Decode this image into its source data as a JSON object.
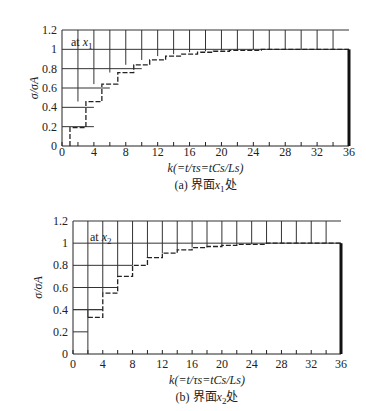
{
  "chart_data": [
    {
      "type": "line",
      "subtype": "step",
      "caption": "(a) 界面x₁处",
      "annotation": "at x₁",
      "xlabel": "k(=t/τs=tCs/Ls)",
      "ylabel": "σ/σA",
      "xlim": [
        0,
        36
      ],
      "ylim": [
        0,
        1.2
      ],
      "xticks": [
        0,
        4,
        8,
        12,
        16,
        20,
        24,
        28,
        32,
        36
      ],
      "yticks": [
        0,
        0.2,
        0.4,
        0.6,
        0.8,
        1,
        1.2
      ],
      "grid": "step staircase grid (solid) with vertical lines every 2 units of k above the curve",
      "series": [
        {
          "name": "dashed step response",
          "style": "dashed",
          "x": [
            1,
            3,
            5,
            7,
            9,
            11,
            13,
            15,
            17,
            19,
            21,
            23,
            25,
            27,
            29,
            31,
            33,
            35
          ],
          "values": [
            0.19,
            0.46,
            0.64,
            0.76,
            0.84,
            0.89,
            0.93,
            0.95,
            0.97,
            0.98,
            0.99,
            0.99,
            1.0,
            1.0,
            1.0,
            1.0,
            1.0,
            1.0
          ]
        },
        {
          "name": "solid staircase (upper grid)",
          "style": "solid",
          "x": [
            0,
            2,
            4,
            6,
            8,
            10,
            12,
            14,
            16,
            18,
            20,
            22,
            24,
            26,
            28,
            30,
            32,
            34
          ],
          "values": [
            0.2,
            0.4,
            0.6,
            0.8,
            0.8,
            1.0,
            1.0,
            1.2,
            1.2,
            1.2,
            1.2,
            1.2,
            1.2,
            1.2,
            1.2,
            1.2,
            1.2,
            1.2
          ]
        }
      ],
      "end_marker": {
        "x": 36,
        "from": 0,
        "to": 1.0,
        "style": "thick vertical line"
      }
    },
    {
      "type": "line",
      "subtype": "step",
      "caption": "(b) 界面x₂处",
      "annotation": "at x₂",
      "xlabel": "k(=t/τs=tCs/Ls)",
      "ylabel": "σ/σA",
      "xlim": [
        0,
        36
      ],
      "ylim": [
        0,
        1.2
      ],
      "xticks": [
        0,
        4,
        8,
        12,
        16,
        20,
        24,
        28,
        32,
        36
      ],
      "yticks": [
        0,
        0.2,
        0.4,
        0.6,
        0.8,
        1,
        1.2
      ],
      "grid": "step staircase grid (solid) with vertical lines every 2 units of k above the curve",
      "series": [
        {
          "name": "dashed step response",
          "style": "dashed",
          "x": [
            2,
            4,
            6,
            8,
            10,
            12,
            14,
            16,
            18,
            20,
            22,
            24,
            26,
            28,
            30,
            32,
            34,
            36
          ],
          "values": [
            0.33,
            0.55,
            0.7,
            0.8,
            0.87,
            0.91,
            0.94,
            0.96,
            0.97,
            0.98,
            0.99,
            0.99,
            1.0,
            1.0,
            1.0,
            1.0,
            1.0,
            1.0
          ]
        }
      ],
      "end_marker": {
        "x": 36,
        "from": 0,
        "to": 1.0,
        "style": "thick vertical line"
      }
    }
  ],
  "labels": {
    "a_caption_prefix": "(a) 界面",
    "a_caption_var": "x",
    "a_caption_sub": "1",
    "a_caption_suffix": "处",
    "b_caption_prefix": "(b) 界面",
    "b_caption_var": "x",
    "b_caption_sub": "2",
    "b_caption_suffix": "处",
    "at": "at",
    "x_var": "x",
    "sub1": "1",
    "sub2": "2",
    "xlabel": "k(=t/τs=tCs/Ls)",
    "ylabel": "σ/σA"
  }
}
